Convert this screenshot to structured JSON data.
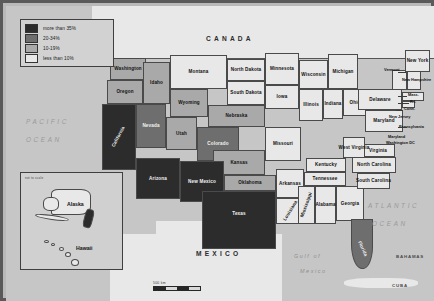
{
  "map": {
    "title": "United States choropleth map",
    "legend": {
      "items": [
        {
          "label": "more than 35%",
          "color": "#2c2c2c",
          "bucket": "hi"
        },
        {
          "label": "20-34%",
          "color": "#6e6e6e",
          "bucket": "mid"
        },
        {
          "label": "10-19%",
          "color": "#a9a9a9",
          "bucket": "low"
        },
        {
          "label": "less than 10%",
          "color": "#e8e8e8",
          "bucket": "min"
        }
      ]
    },
    "scale": {
      "label": "500 km"
    },
    "inset": {
      "note": "not to scale",
      "alaska": "Alaska",
      "hawaii": "Hawaii"
    },
    "countries": [
      {
        "name": "CANADA"
      },
      {
        "name": "MEXICO"
      }
    ],
    "oceans": [
      {
        "name": "PACIFIC"
      },
      {
        "name": "OCEAN"
      },
      {
        "name": "ATLANTIC"
      },
      {
        "name": "OCEAN"
      }
    ],
    "waters": [
      {
        "name": "Gulf of"
      },
      {
        "name": "Mexico"
      }
    ],
    "islands": [
      {
        "name": "BAHAMAS"
      },
      {
        "name": "CUBA"
      }
    ],
    "states": [
      {
        "name": "Washington",
        "bucket": "low"
      },
      {
        "name": "Oregon",
        "bucket": "low"
      },
      {
        "name": "Idaho",
        "bucket": "low"
      },
      {
        "name": "Montana",
        "bucket": "min"
      },
      {
        "name": "Wyoming",
        "bucket": "low"
      },
      {
        "name": "North Dakota",
        "bucket": "min"
      },
      {
        "name": "South Dakota",
        "bucket": "min"
      },
      {
        "name": "Minnesota",
        "bucket": "min"
      },
      {
        "name": "Wisconsin",
        "bucket": "min"
      },
      {
        "name": "Michigan",
        "bucket": "min"
      },
      {
        "name": "Nebraska",
        "bucket": "low"
      },
      {
        "name": "Iowa",
        "bucket": "min"
      },
      {
        "name": "Illinois",
        "bucket": "min"
      },
      {
        "name": "Indiana",
        "bucket": "min"
      },
      {
        "name": "Ohio",
        "bucket": "min"
      },
      {
        "name": "California",
        "bucket": "hi"
      },
      {
        "name": "Nevada",
        "bucket": "mid"
      },
      {
        "name": "Utah",
        "bucket": "low"
      },
      {
        "name": "Colorado",
        "bucket": "mid"
      },
      {
        "name": "Kansas",
        "bucket": "low"
      },
      {
        "name": "Missouri",
        "bucket": "min"
      },
      {
        "name": "Kentucky",
        "bucket": "min"
      },
      {
        "name": "Arizona",
        "bucket": "hi"
      },
      {
        "name": "New Mexico",
        "bucket": "hi"
      },
      {
        "name": "Oklahoma",
        "bucket": "low"
      },
      {
        "name": "Arkansas",
        "bucket": "min"
      },
      {
        "name": "Tennessee",
        "bucket": "min"
      },
      {
        "name": "Texas",
        "bucket": "hi"
      },
      {
        "name": "Louisiana",
        "bucket": "min"
      },
      {
        "name": "Mississippi",
        "bucket": "min"
      },
      {
        "name": "Alabama",
        "bucket": "min"
      },
      {
        "name": "Georgia",
        "bucket": "min"
      },
      {
        "name": "Florida",
        "bucket": "mid"
      },
      {
        "name": "South Carolina",
        "bucket": "min"
      },
      {
        "name": "North Carolina",
        "bucket": "min"
      },
      {
        "name": "Virginia",
        "bucket": "min"
      },
      {
        "name": "West Virginia",
        "bucket": "min"
      },
      {
        "name": "Maryland",
        "bucket": "min"
      },
      {
        "name": "Delaware",
        "bucket": "min"
      },
      {
        "name": "Pennsylvania",
        "bucket": "min"
      },
      {
        "name": "New Jersey",
        "bucket": "min"
      },
      {
        "name": "New York",
        "bucket": "min"
      },
      {
        "name": "Vermont",
        "bucket": "min"
      },
      {
        "name": "New Hampshire",
        "bucket": "min"
      },
      {
        "name": "Maine",
        "bucket": "min"
      },
      {
        "name": "Mass.",
        "bucket": "min"
      },
      {
        "name": "R.I.",
        "bucket": "min"
      },
      {
        "name": "Conn.",
        "bucket": "min"
      },
      {
        "name": "Washington DC",
        "bucket": "min"
      }
    ]
  }
}
